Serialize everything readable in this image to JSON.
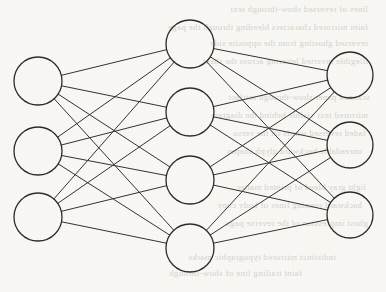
{
  "diagram": {
    "type": "neural-network",
    "canvas": {
      "width": 386,
      "height": 292,
      "background_color": "#f8f7f4"
    },
    "style": {
      "node_stroke_color": "#2b2b2b",
      "node_stroke_width": 1.3,
      "node_fill_color": "none",
      "edge_stroke_color": "#333333",
      "edge_stroke_width": 1.0,
      "ghost_text_color": "#b9b5ad"
    },
    "layers": [
      {
        "name": "input-layer",
        "label": "Input Layer",
        "node_count": 3,
        "radius": 24,
        "nodes": [
          {
            "id": "i1",
            "label": "",
            "cx": 38,
            "cy": 81
          },
          {
            "id": "i2",
            "label": "",
            "cx": 38,
            "cy": 151
          },
          {
            "id": "i3",
            "label": "",
            "cx": 38,
            "cy": 217
          }
        ]
      },
      {
        "name": "hidden-layer",
        "label": "Hidden Layer",
        "node_count": 4,
        "radius": 24,
        "nodes": [
          {
            "id": "h1",
            "label": "",
            "cx": 190,
            "cy": 44
          },
          {
            "id": "h2",
            "label": "",
            "cx": 190,
            "cy": 112
          },
          {
            "id": "h3",
            "label": "",
            "cx": 190,
            "cy": 180
          },
          {
            "id": "h4",
            "label": "",
            "cx": 190,
            "cy": 248
          }
        ]
      },
      {
        "name": "output-layer",
        "label": "Output Layer",
        "node_count": 3,
        "radius": 23,
        "nodes": [
          {
            "id": "o1",
            "label": "",
            "cx": 350,
            "cy": 75
          },
          {
            "id": "o2",
            "label": "",
            "cx": 350,
            "cy": 145
          },
          {
            "id": "o3",
            "label": "",
            "cx": 350,
            "cy": 215
          }
        ]
      }
    ],
    "connections": {
      "description": "fully-connected between adjacent layers",
      "edge_count": 24,
      "pairs": [
        [
          "i1",
          "h1"
        ],
        [
          "i1",
          "h2"
        ],
        [
          "i1",
          "h3"
        ],
        [
          "i1",
          "h4"
        ],
        [
          "i2",
          "h1"
        ],
        [
          "i2",
          "h2"
        ],
        [
          "i2",
          "h3"
        ],
        [
          "i2",
          "h4"
        ],
        [
          "i3",
          "h1"
        ],
        [
          "i3",
          "h2"
        ],
        [
          "i3",
          "h3"
        ],
        [
          "i3",
          "h4"
        ],
        [
          "h1",
          "o1"
        ],
        [
          "h1",
          "o2"
        ],
        [
          "h1",
          "o3"
        ],
        [
          "h2",
          "o1"
        ],
        [
          "h2",
          "o2"
        ],
        [
          "h2",
          "o3"
        ],
        [
          "h3",
          "o1"
        ],
        [
          "h3",
          "o2"
        ],
        [
          "h3",
          "o3"
        ],
        [
          "h4",
          "o1"
        ],
        [
          "h4",
          "o2"
        ],
        [
          "h4",
          "o3"
        ]
      ]
    },
    "background_ghost_text": {
      "description": "faint mirrored show-through text from reverse side of scanned page; illegible",
      "lines": [
        {
          "text": "lines of reversed show-through text",
          "x": 16,
          "y": 4,
          "size": 9,
          "width": 352
        },
        {
          "text": "faint mirrored characters bleeding through the page",
          "x": 28,
          "y": 22,
          "size": 9,
          "width": 340
        },
        {
          "text": "reversed ghosting from the opposite side",
          "x": 12,
          "y": 38,
          "size": 9,
          "width": 356
        },
        {
          "text": "illegible inverted lettering across the sheet",
          "x": 20,
          "y": 56,
          "size": 9,
          "width": 348
        },
        {
          "text": "scanned paper show-through artifact",
          "x": 10,
          "y": 92,
          "size": 9,
          "width": 360
        },
        {
          "text": "mirrored text visible behind the diagram",
          "x": 24,
          "y": 110,
          "size": 9,
          "width": 344
        },
        {
          "text": "faded reversed words on the verso",
          "x": 14,
          "y": 128,
          "size": 9,
          "width": 352
        },
        {
          "text": "unreadable backward glyph shapes",
          "x": 30,
          "y": 146,
          "size": 9,
          "width": 332
        },
        {
          "text": "light gray bleed of printed matter",
          "x": 18,
          "y": 182,
          "size": 9,
          "width": 348
        },
        {
          "text": "backward running lines of body copy",
          "x": 26,
          "y": 200,
          "size": 9,
          "width": 336
        },
        {
          "text": "ghost impression of the reverse page",
          "x": 12,
          "y": 218,
          "size": 9,
          "width": 356
        },
        {
          "text": "indistinct mirrored typographic marks",
          "x": 86,
          "y": 252,
          "size": 9,
          "width": 250
        },
        {
          "text": "faint trailing line of show-through",
          "x": 132,
          "y": 268,
          "size": 9,
          "width": 170
        }
      ]
    }
  }
}
